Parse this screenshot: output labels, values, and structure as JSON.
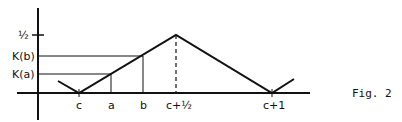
{
  "figure": {
    "caption": "Fig. 2",
    "y_labels": {
      "half": "½",
      "kb": "K(b)",
      "ka": "K(a)"
    },
    "x_labels": {
      "c": "c",
      "a": "a",
      "b": "b",
      "c_half": "c+½",
      "c_plus_1": "c+1"
    },
    "stroke_color": "#111111",
    "background": "#ffffff"
  }
}
